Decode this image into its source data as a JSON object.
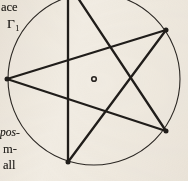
{
  "page": {
    "kind": "scanned-book-page-fragment",
    "width": 188,
    "height": 181,
    "background_color": "#f1ece3",
    "ink_color": "#221f1c"
  },
  "margin_text": {
    "line_ace": "ace",
    "line_gamma_base": "Γ",
    "line_gamma_subscript": "1",
    "line_pos": "pos-",
    "line_m": "m-",
    "line_all": "all"
  },
  "figure": {
    "caption_visible": false,
    "circle": {
      "label": "circumscribed-circle",
      "center_x": 94,
      "center_y": 79,
      "radius": 86,
      "stroke_color": "#2b2723",
      "stroke_width": 1.1,
      "clipped_at_top": true
    },
    "center_marker": {
      "label": "center-point",
      "x": 94,
      "y": 79,
      "outer_radius": 3.1,
      "inner_radius": 1.5,
      "stroke_color": "#2a2623"
    },
    "star": {
      "label": "pentagram",
      "points": 5,
      "stroke_color": "#201d1a",
      "stroke_width": 2.3,
      "vertices": [
        {
          "name": "vertex-top",
          "x": 68,
          "y": -17,
          "visible": false,
          "marker": false
        },
        {
          "name": "vertex-upper-right",
          "x": 166,
          "y": 30,
          "visible": true,
          "marker": true
        },
        {
          "name": "vertex-lower-right",
          "x": 166,
          "y": 131,
          "visible": true,
          "marker": true
        },
        {
          "name": "vertex-bottom",
          "x": 68,
          "y": 162,
          "visible": true,
          "marker": true
        },
        {
          "name": "vertex-left",
          "x": 7,
          "y": 79,
          "visible": true,
          "marker": true
        }
      ],
      "chords": [
        {
          "name": "chord-top-to-lower-right",
          "from": 0,
          "to": 2
        },
        {
          "name": "chord-lower-right-to-left",
          "from": 2,
          "to": 4
        },
        {
          "name": "chord-left-to-upper-right",
          "from": 4,
          "to": 1
        },
        {
          "name": "chord-upper-right-to-bottom",
          "from": 1,
          "to": 3
        },
        {
          "name": "chord-bottom-to-top",
          "from": 3,
          "to": 0
        }
      ]
    }
  }
}
